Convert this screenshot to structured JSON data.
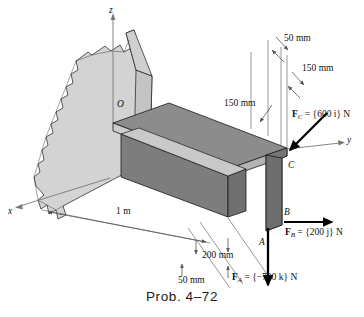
{
  "figure": {
    "caption": "Prob. 4–72",
    "axes": [
      {
        "name": "z-axis-label",
        "label": "z"
      },
      {
        "name": "x-axis-label",
        "label": "x"
      },
      {
        "name": "y-axis-label",
        "label": "y"
      }
    ],
    "points": [
      {
        "name": "point-o",
        "label": "O"
      },
      {
        "name": "point-a",
        "label": "A"
      },
      {
        "name": "point-b",
        "label": "B"
      },
      {
        "name": "point-c",
        "label": "C"
      }
    ],
    "dimensions": [
      {
        "name": "dimension-50mm-top",
        "label": "50 mm"
      },
      {
        "name": "dimension-150mm-right",
        "label": "150 mm"
      },
      {
        "name": "dimension-150mm-left",
        "label": "150 mm"
      },
      {
        "name": "dimension-1m",
        "label": "1 m"
      },
      {
        "name": "dimension-200mm",
        "label": "200 mm"
      },
      {
        "name": "dimension-50mm-bottom",
        "label": "50 mm"
      }
    ],
    "forces": [
      {
        "name": "force-c",
        "symbol": "F",
        "subscript": "C",
        "equals": "=",
        "value": "{600 i} N",
        "magnitude": 600,
        "direction": "i",
        "units": "N"
      },
      {
        "name": "force-b",
        "symbol": "F",
        "subscript": "B",
        "equals": "=",
        "value": "{200 j} N",
        "magnitude": 200,
        "direction": "j",
        "units": "N"
      },
      {
        "name": "force-a",
        "symbol": "F",
        "subscript": "A",
        "equals": "=",
        "value": "{−700 k} N",
        "magnitude": -700,
        "direction": "k",
        "units": "N"
      }
    ],
    "colors": {
      "wall_fill": "#d3d3d3",
      "plate_top": "#8c8c8c",
      "plate_edge": "#c9c9c9",
      "web_side": "#6f6f6f",
      "outline": "#1a1a1a",
      "dimension_line": "#6b6b6b",
      "background": "#ffffff"
    }
  }
}
